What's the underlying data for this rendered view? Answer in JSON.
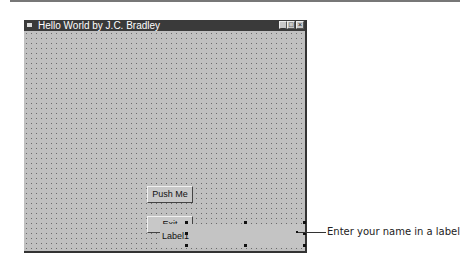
{
  "window": {
    "title": "Hello World by J.C. Bradley",
    "controls": {
      "minimize": "_",
      "maximize": "□",
      "close": "×"
    }
  },
  "form": {
    "buttons": [
      {
        "label": "Push Me"
      },
      {
        "label": "Exit"
      }
    ],
    "label": {
      "text": "Label1",
      "selected": true
    }
  },
  "annotation": {
    "text": "Enter your name in a label"
  }
}
